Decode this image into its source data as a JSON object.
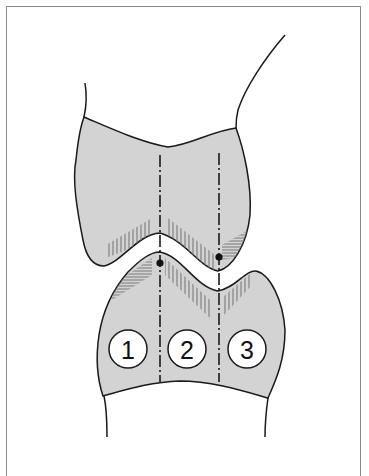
{
  "diagram": {
    "type": "joint-cross-section",
    "colors": {
      "bone_fill": "#d3d3d3",
      "outline": "#1a1a1a",
      "hatch": "#7a7a7a",
      "frame": "#8a8a8a",
      "label_circle_fill": "#ffffff"
    },
    "zones": [
      {
        "id": "zone-1",
        "label": "1"
      },
      {
        "id": "zone-2",
        "label": "2"
      },
      {
        "id": "zone-3",
        "label": "3"
      }
    ],
    "axis_lines": [
      {
        "id": "axis-left",
        "style": "dash-dot"
      },
      {
        "id": "axis-right",
        "style": "dash-dot"
      }
    ],
    "contact_points": [
      {
        "id": "contact-left"
      },
      {
        "id": "contact-right"
      }
    ]
  }
}
